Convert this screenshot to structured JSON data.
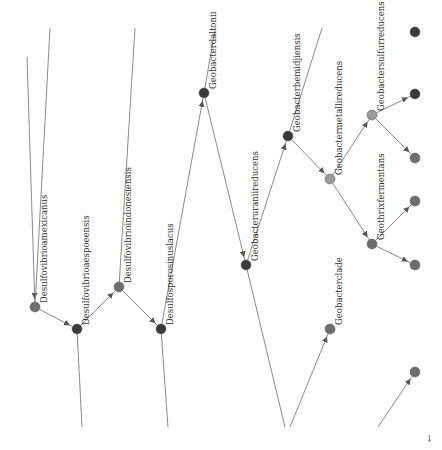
{
  "colors": {
    "edge": "#8a8a8a",
    "node_dark": "#3a3a3a",
    "node_mid": "#6e6e6e",
    "node_light": "#9a9a9a",
    "label": "#333333"
  },
  "nodes": [
    {
      "id": "desulfovibrio_amexicanus",
      "label": "Desulfovibrioamexicanus",
      "x": 35,
      "y": 307,
      "r": 5,
      "shade": "mid"
    },
    {
      "id": "desulfovibrio_aespoeensis",
      "label": "Desulfovibrioaespoeensis",
      "x": 77,
      "y": 329,
      "r": 5,
      "shade": "dark"
    },
    {
      "id": "desulfovibrio_indonesiensis",
      "label": "Desulfovibrioindonesiensis",
      "x": 119,
      "y": 287,
      "r": 5,
      "shade": "mid"
    },
    {
      "id": "desulfosporosinus_lacus",
      "label": "Desulfosporosinuslacus",
      "x": 161,
      "y": 329,
      "r": 5,
      "shade": "dark"
    },
    {
      "id": "geobacter_dalton",
      "label": "Geobacterdaltonii",
      "x": 204,
      "y": 93,
      "r": 5,
      "shade": "dark"
    },
    {
      "id": "geobacter_uraniireducens",
      "label": "Geobacteruraniireducens",
      "x": 246,
      "y": 265,
      "r": 5,
      "shade": "dark"
    },
    {
      "id": "geobacter_bemidjiensis",
      "label": "Geobacterbemidjiensis",
      "x": 288,
      "y": 136,
      "r": 5,
      "shade": "dark"
    },
    {
      "id": "geobacter_metallireducens",
      "label": "Geobactermetallireducens",
      "x": 330,
      "y": 179,
      "r": 5,
      "shade": "light"
    },
    {
      "id": "geobacter_sulfurreducens",
      "label": "Geobactersulfurreducens",
      "x": 372,
      "y": 115,
      "r": 5,
      "shade": "light"
    },
    {
      "id": "geothrix_fermentans",
      "label": "Geothrixfermentans",
      "x": 372,
      "y": 244,
      "r": 5,
      "shade": "mid"
    },
    {
      "id": "geobacter_clade",
      "label": "Geobacterclade",
      "x": 330,
      "y": 329,
      "r": 5,
      "shade": "mid"
    },
    {
      "id": "leaf_a",
      "label": "",
      "x": 415,
      "y": 94,
      "r": 5,
      "shade": "dark"
    },
    {
      "id": "leaf_b",
      "label": "",
      "x": 415,
      "y": 158,
      "r": 5,
      "shade": "mid"
    },
    {
      "id": "leaf_c",
      "label": "",
      "x": 415,
      "y": 201,
      "r": 5,
      "shade": "mid"
    },
    {
      "id": "leaf_d",
      "label": "",
      "x": 415,
      "y": 265,
      "r": 5,
      "shade": "mid"
    },
    {
      "id": "leaf_e",
      "label": "",
      "x": 415,
      "y": 372,
      "r": 5,
      "shade": "mid"
    },
    {
      "id": "leaf_top",
      "label": "",
      "x": 415,
      "y": 32,
      "r": 5,
      "shade": "dark"
    }
  ],
  "edges": [
    {
      "from": [
        27,
        57
      ],
      "to": "desulfovibrio_amexicanus",
      "arrow": true
    },
    {
      "from": [
        50,
        28
      ],
      "to": "desulfovibrio_amexicanus",
      "arrow": false
    },
    {
      "from": "desulfovibrio_amexicanus",
      "to": "desulfovibrio_aespoeensis",
      "arrow": true
    },
    {
      "from": "desulfovibrio_aespoeensis",
      "to": [
        82,
        427
      ],
      "arrow": false
    },
    {
      "from": "desulfovibrio_aespoeensis",
      "to": "desulfovibrio_indonesiensis",
      "arrow": true
    },
    {
      "from": [
        135,
        28
      ],
      "to": "desulfovibrio_indonesiensis",
      "arrow": false
    },
    {
      "from": "desulfovibrio_indonesiensis",
      "to": "desulfosporosinus_lacus",
      "arrow": true
    },
    {
      "from": "desulfosporosinus_lacus",
      "to": [
        168,
        427
      ],
      "arrow": false
    },
    {
      "from": "desulfosporosinus_lacus",
      "to": "geobacter_dalton",
      "arrow": true
    },
    {
      "from": [
        215,
        30
      ],
      "to": "geobacter_dalton",
      "arrow": false
    },
    {
      "from": "geobacter_dalton",
      "to": "geobacter_uraniireducens",
      "arrow": true
    },
    {
      "from": "geobacter_uraniireducens",
      "to": [
        285,
        427
      ],
      "arrow": false
    },
    {
      "from": "geobacter_uraniireducens",
      "to": "geobacter_bemidjiensis",
      "arrow": true
    },
    {
      "from": [
        322,
        28
      ],
      "to": "geobacter_bemidjiensis",
      "arrow": false
    },
    {
      "from": "geobacter_bemidjiensis",
      "to": "geobacter_metallireducens",
      "arrow": true
    },
    {
      "from": "geobacter_metallireducens",
      "to": "geobacter_sulfurreducens",
      "arrow": true
    },
    {
      "from": "geobacter_metallireducens",
      "to": "geothrix_fermentans",
      "arrow": true
    },
    {
      "from": "geobacter_sulfurreducens",
      "to": "leaf_a",
      "arrow": true
    },
    {
      "from": "geobacter_sulfurreducens",
      "to": "leaf_b",
      "arrow": true
    },
    {
      "from": "geothrix_fermentans",
      "to": "leaf_c",
      "arrow": true
    },
    {
      "from": "geothrix_fermentans",
      "to": "leaf_d",
      "arrow": true
    },
    {
      "from": [
        290,
        427
      ],
      "to": "geobacter_clade",
      "arrow": true
    },
    {
      "from": [
        378,
        427
      ],
      "to": "leaf_e",
      "arrow": true
    }
  ],
  "corner_mark": "←"
}
